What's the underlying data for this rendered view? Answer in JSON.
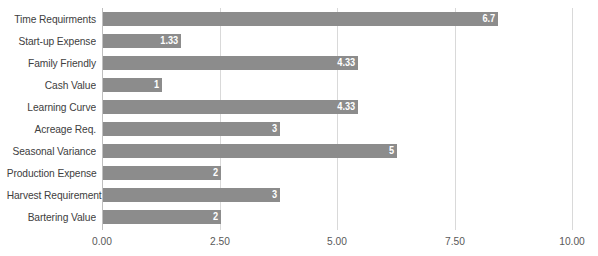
{
  "chart_data": {
    "type": "bar",
    "orientation": "horizontal",
    "title": "",
    "subtitle": "",
    "xlabel": "",
    "ylabel": "",
    "grid": true,
    "legend": false,
    "xlim": [
      0,
      10
    ],
    "xticks": [
      "0.00",
      "2.50",
      "5.00",
      "7.50",
      "10.00"
    ],
    "xtick_values": [
      0,
      2.5,
      5,
      7.5,
      10
    ],
    "categories": [
      "Time Requirments",
      "Start-up Expense",
      "Family Friendly",
      "Cash Value",
      "Learning Curve",
      "Acreage Req.",
      "Seasonal Variance",
      "Production Expense",
      "Harvest Requirement",
      "Bartering Value"
    ],
    "values": [
      6.7,
      1.33,
      4.33,
      1,
      4.33,
      3,
      5,
      2,
      3,
      2
    ],
    "value_labels": [
      "6.7",
      "1.33",
      "4.33",
      "1",
      "4.33",
      "3",
      "5",
      "2",
      "3",
      "2"
    ],
    "bar_pixel_lengths": [
      395,
      78,
      255,
      59,
      255,
      177,
      294,
      118,
      177,
      118
    ],
    "colors": {
      "bar": "#8c8c8c",
      "value_label": "#ffffff",
      "category_label": "#404040",
      "tick_label": "#595959",
      "gridline": "#d9d9d9",
      "axis_line": "#bfbfbf",
      "background": "#ffffff"
    }
  }
}
